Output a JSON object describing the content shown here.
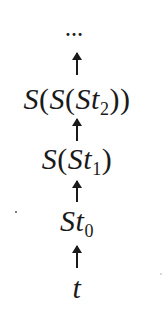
{
  "diagram": {
    "type": "successor-chain",
    "direction": "bottom-to-top",
    "ellipsis": "…",
    "nodes": [
      {
        "id": "n3",
        "prefix": "S(S(S",
        "var": "t",
        "subscript": "2",
        "suffix": "))",
        "display": "S(S(St₂))"
      },
      {
        "id": "n2",
        "prefix": "S(S",
        "var": "t",
        "subscript": "1",
        "suffix": ")",
        "display": "S(St₁)"
      },
      {
        "id": "n1",
        "prefix": "S",
        "var": "t",
        "subscript": "0",
        "suffix": "",
        "display": "St₀"
      },
      {
        "id": "n0",
        "prefix": "",
        "var": "t",
        "subscript": "",
        "suffix": "",
        "display": "t"
      }
    ],
    "edges": [
      {
        "from": "n0",
        "to": "n1",
        "symbol": "↑"
      },
      {
        "from": "n1",
        "to": "n2",
        "symbol": "↑"
      },
      {
        "from": "n2",
        "to": "n3",
        "symbol": "↑"
      },
      {
        "from": "n3",
        "to": "ellipsis",
        "symbol": "↑"
      }
    ],
    "colors": {
      "ink": "#1a1a1a",
      "background": "#ffffff"
    }
  }
}
